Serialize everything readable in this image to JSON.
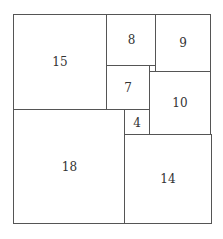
{
  "diagram": {
    "type": "squared-rectangle",
    "width_units": 32,
    "height_units": 33,
    "squares": [
      {
        "label": "15",
        "size": 15,
        "x": 0,
        "y": 0
      },
      {
        "label": "8",
        "size": 8,
        "x": 15,
        "y": 0
      },
      {
        "label": "9",
        "size": 9,
        "x": 23,
        "y": 0
      },
      {
        "label": "7",
        "size": 7,
        "x": 15,
        "y": 8
      },
      {
        "label": "1",
        "size": 1,
        "x": 22,
        "y": 8
      },
      {
        "label": "10",
        "size": 10,
        "x": 22,
        "y": 9
      },
      {
        "label": "18",
        "size": 18,
        "x": 0,
        "y": 15
      },
      {
        "label": "4",
        "size": 4,
        "x": 18,
        "y": 15
      },
      {
        "label": "14",
        "size": 14,
        "x": 18,
        "y": 19
      }
    ]
  }
}
